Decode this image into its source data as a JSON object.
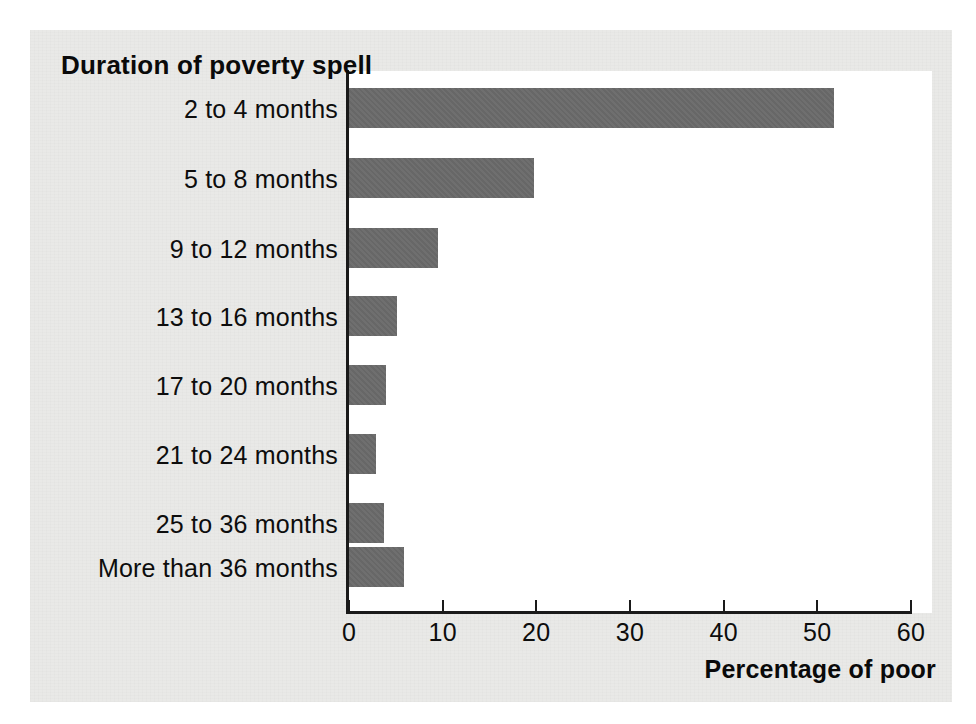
{
  "chart_data": {
    "type": "bar",
    "orientation": "horizontal",
    "title": "Duration of poverty spell",
    "xlabel": "Percentage of poor",
    "ylabel": "Duration of poverty spell",
    "categories": [
      "2 to 4 months",
      "5 to 8 months",
      "9 to 12 months",
      "13 to 16 months",
      "17 to 20 months",
      "21 to 24 months",
      "25 to 36 months",
      "More than 36 months"
    ],
    "values": [
      51.8,
      19.7,
      9.5,
      5.1,
      3.9,
      2.9,
      3.7,
      5.9
    ],
    "xlim": [
      0,
      60
    ],
    "xticks": [
      0,
      10,
      20,
      30,
      40,
      50,
      60
    ],
    "xticklabels": [
      "0",
      "10",
      "20",
      "30",
      "40",
      "50",
      "60"
    ],
    "grid": false,
    "legend": null,
    "bar_color": "#6a6a6a",
    "axis_color": "#1a1a1a",
    "plot_background": "#ffffff",
    "page_background": "#e9e9e7"
  }
}
